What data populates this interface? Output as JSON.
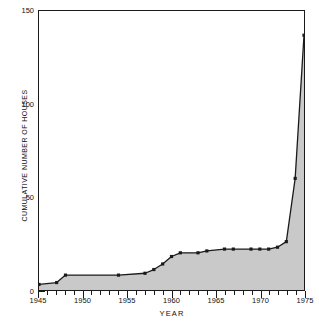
{
  "chart_data": {
    "type": "area",
    "title": "",
    "xlabel": "YEAR",
    "ylabel": "CUMULATIVE NUMBER OF HOUSES",
    "xlim": [
      1945,
      1975
    ],
    "ylim": [
      0,
      150
    ],
    "grid": false,
    "legend": null,
    "fill_color": "#c9c9c9",
    "line_color": "#1a1a1a",
    "marker": "square",
    "y_major_ticks": [
      0,
      50,
      100,
      150
    ],
    "y_major_tick_labels": [
      "0",
      "50",
      "100",
      "150"
    ],
    "y_minor_tick_step": 10,
    "x_major_ticks": [
      1945,
      1950,
      1955,
      1960,
      1965,
      1970,
      1975
    ],
    "x_major_tick_labels": [
      "1945",
      "1950",
      "1955",
      "1960",
      "1965",
      "1970",
      "1975"
    ],
    "x_minor_tick_step": 1,
    "x": [
      1945,
      1947,
      1948,
      1954,
      1957,
      1958,
      1959,
      1960,
      1961,
      1963,
      1964,
      1966,
      1967,
      1969,
      1970,
      1971,
      1972,
      1973,
      1974,
      1975
    ],
    "values": [
      3,
      4,
      8,
      8,
      9,
      11,
      14,
      18,
      20,
      20,
      21,
      22,
      22,
      22,
      22,
      22,
      23,
      26,
      60,
      137
    ],
    "points": [
      {
        "year": 1945,
        "houses": 3
      },
      {
        "year": 1947,
        "houses": 4
      },
      {
        "year": 1948,
        "houses": 8
      },
      {
        "year": 1954,
        "houses": 8
      },
      {
        "year": 1957,
        "houses": 9
      },
      {
        "year": 1958,
        "houses": 11
      },
      {
        "year": 1959,
        "houses": 14
      },
      {
        "year": 1960,
        "houses": 18
      },
      {
        "year": 1961,
        "houses": 20
      },
      {
        "year": 1963,
        "houses": 20
      },
      {
        "year": 1964,
        "houses": 21
      },
      {
        "year": 1966,
        "houses": 22
      },
      {
        "year": 1967,
        "houses": 22
      },
      {
        "year": 1969,
        "houses": 22
      },
      {
        "year": 1970,
        "houses": 22
      },
      {
        "year": 1971,
        "houses": 22
      },
      {
        "year": 1972,
        "houses": 23
      },
      {
        "year": 1973,
        "houses": 26
      },
      {
        "year": 1974,
        "houses": 60
      },
      {
        "year": 1975,
        "houses": 137
      }
    ]
  }
}
